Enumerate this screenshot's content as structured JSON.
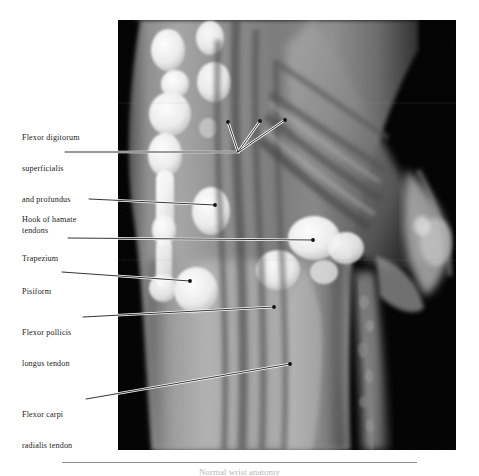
{
  "figure": {
    "modality": "mri-wrist-sagittal",
    "caption": "Normal wrist anatomy"
  },
  "annotations": [
    {
      "id": "flexor-digitorum",
      "lines": [
        "Flexor digitorum",
        "superficialis",
        "and profundus",
        "tendons"
      ],
      "text_x": 22,
      "text_y": 116,
      "leader_start_x": 65,
      "leader_start_y": 152,
      "elbow_x": 238,
      "elbow_y": 152,
      "tips": [
        {
          "x": 228,
          "y": 122
        },
        {
          "x": 260,
          "y": 121
        },
        {
          "x": 285,
          "y": 120
        }
      ]
    },
    {
      "id": "hook-of-hamate",
      "lines": [
        "Hook of hamate"
      ],
      "text_x": 22,
      "text_y": 194,
      "leader_start_x": 89,
      "leader_start_y": 199,
      "tips": [
        {
          "x": 215,
          "y": 205
        }
      ]
    },
    {
      "id": "trapezium",
      "lines": [
        "Trapezium"
      ],
      "text_x": 22,
      "text_y": 233,
      "leader_start_x": 68,
      "leader_start_y": 238,
      "tips": [
        {
          "x": 313,
          "y": 240
        }
      ]
    },
    {
      "id": "pisiform",
      "lines": [
        "Pisiform"
      ],
      "text_x": 22,
      "text_y": 266,
      "leader_start_x": 62,
      "leader_start_y": 272,
      "tips": [
        {
          "x": 190,
          "y": 281
        }
      ]
    },
    {
      "id": "flexor-pollicis-longus",
      "lines": [
        "Flexor pollicis",
        "longus tendon"
      ],
      "text_x": 22,
      "text_y": 307,
      "leader_start_x": 83,
      "leader_start_y": 317,
      "tips": [
        {
          "x": 274,
          "y": 307
        }
      ]
    },
    {
      "id": "flexor-carpi-radialis",
      "lines": [
        "Flexor carpi",
        "radialis tendon"
      ],
      "text_x": 22,
      "text_y": 389,
      "leader_start_x": 86,
      "leader_start_y": 399,
      "tips": [
        {
          "x": 290,
          "y": 364
        }
      ]
    }
  ],
  "colors": {
    "leader": "#ffffff",
    "leader_outline": "#000000",
    "label_text": "#1a1a1a",
    "plate_background": "#000000",
    "rule": "#8e8e8e"
  }
}
